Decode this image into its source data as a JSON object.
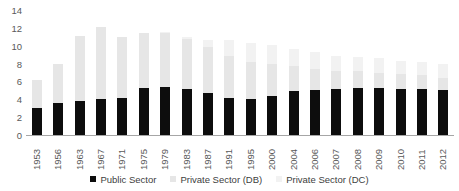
{
  "chart_data": {
    "type": "bar",
    "stacked": true,
    "title": "",
    "subtitle": "",
    "xlabel": "",
    "ylabel": "",
    "ylim": [
      0,
      14
    ],
    "yticks": [
      0,
      2,
      4,
      6,
      8,
      10,
      12,
      14
    ],
    "grid": false,
    "legend_position": "bottom",
    "categories": [
      "1953",
      "1956",
      "1963",
      "1967",
      "1971",
      "1975",
      "1979",
      "1983",
      "1987",
      "1991",
      "1995",
      "2000",
      "2004",
      "2006",
      "2007",
      "2008",
      "2009",
      "2010",
      "2011",
      "2012"
    ],
    "series": [
      {
        "name": "Public Sector",
        "color": "#0d0d0d",
        "values": [
          3.0,
          3.6,
          3.8,
          4.0,
          4.2,
          5.3,
          5.4,
          5.2,
          4.7,
          4.1,
          4.0,
          4.4,
          4.9,
          5.0,
          5.1,
          5.3,
          5.3,
          5.2,
          5.2,
          5.0
        ]
      },
      {
        "name": "Private Sector (DB)",
        "color": "#e6e6e6",
        "values": [
          3.2,
          4.4,
          7.3,
          8.1,
          6.8,
          6.1,
          6.0,
          5.6,
          5.2,
          4.7,
          4.2,
          3.6,
          2.8,
          2.4,
          2.1,
          1.9,
          1.7,
          1.6,
          1.5,
          1.4
        ]
      },
      {
        "name": "Private Sector (DC)",
        "color": "#f2f2f2",
        "values": [
          0.0,
          0.0,
          0.0,
          0.0,
          0.0,
          0.0,
          0.1,
          0.2,
          0.7,
          1.8,
          2.1,
          2.1,
          1.9,
          1.9,
          1.7,
          1.5,
          1.6,
          1.5,
          1.5,
          1.5
        ]
      }
    ],
    "totals": [
      6.2,
      8.0,
      11.1,
      12.1,
      11.0,
      11.4,
      11.5,
      11.0,
      10.6,
      10.6,
      10.3,
      10.1,
      9.6,
      9.3,
      8.9,
      8.7,
      8.6,
      8.3,
      8.2,
      7.9
    ]
  },
  "legend": {
    "items": [
      {
        "label": "Public Sector",
        "color": "#0d0d0d",
        "swatch_name": "legend-swatch-public-sector"
      },
      {
        "label": "Private Sector (DB)",
        "color": "#e6e6e6",
        "swatch_name": "legend-swatch-private-db"
      },
      {
        "label": "Private Sector (DC)",
        "color": "#f2f2f2",
        "swatch_name": "legend-swatch-private-dc"
      }
    ]
  },
  "axis": {
    "y_labels": [
      "14",
      "12",
      "10",
      "8",
      "6",
      "4",
      "2",
      "0"
    ]
  }
}
